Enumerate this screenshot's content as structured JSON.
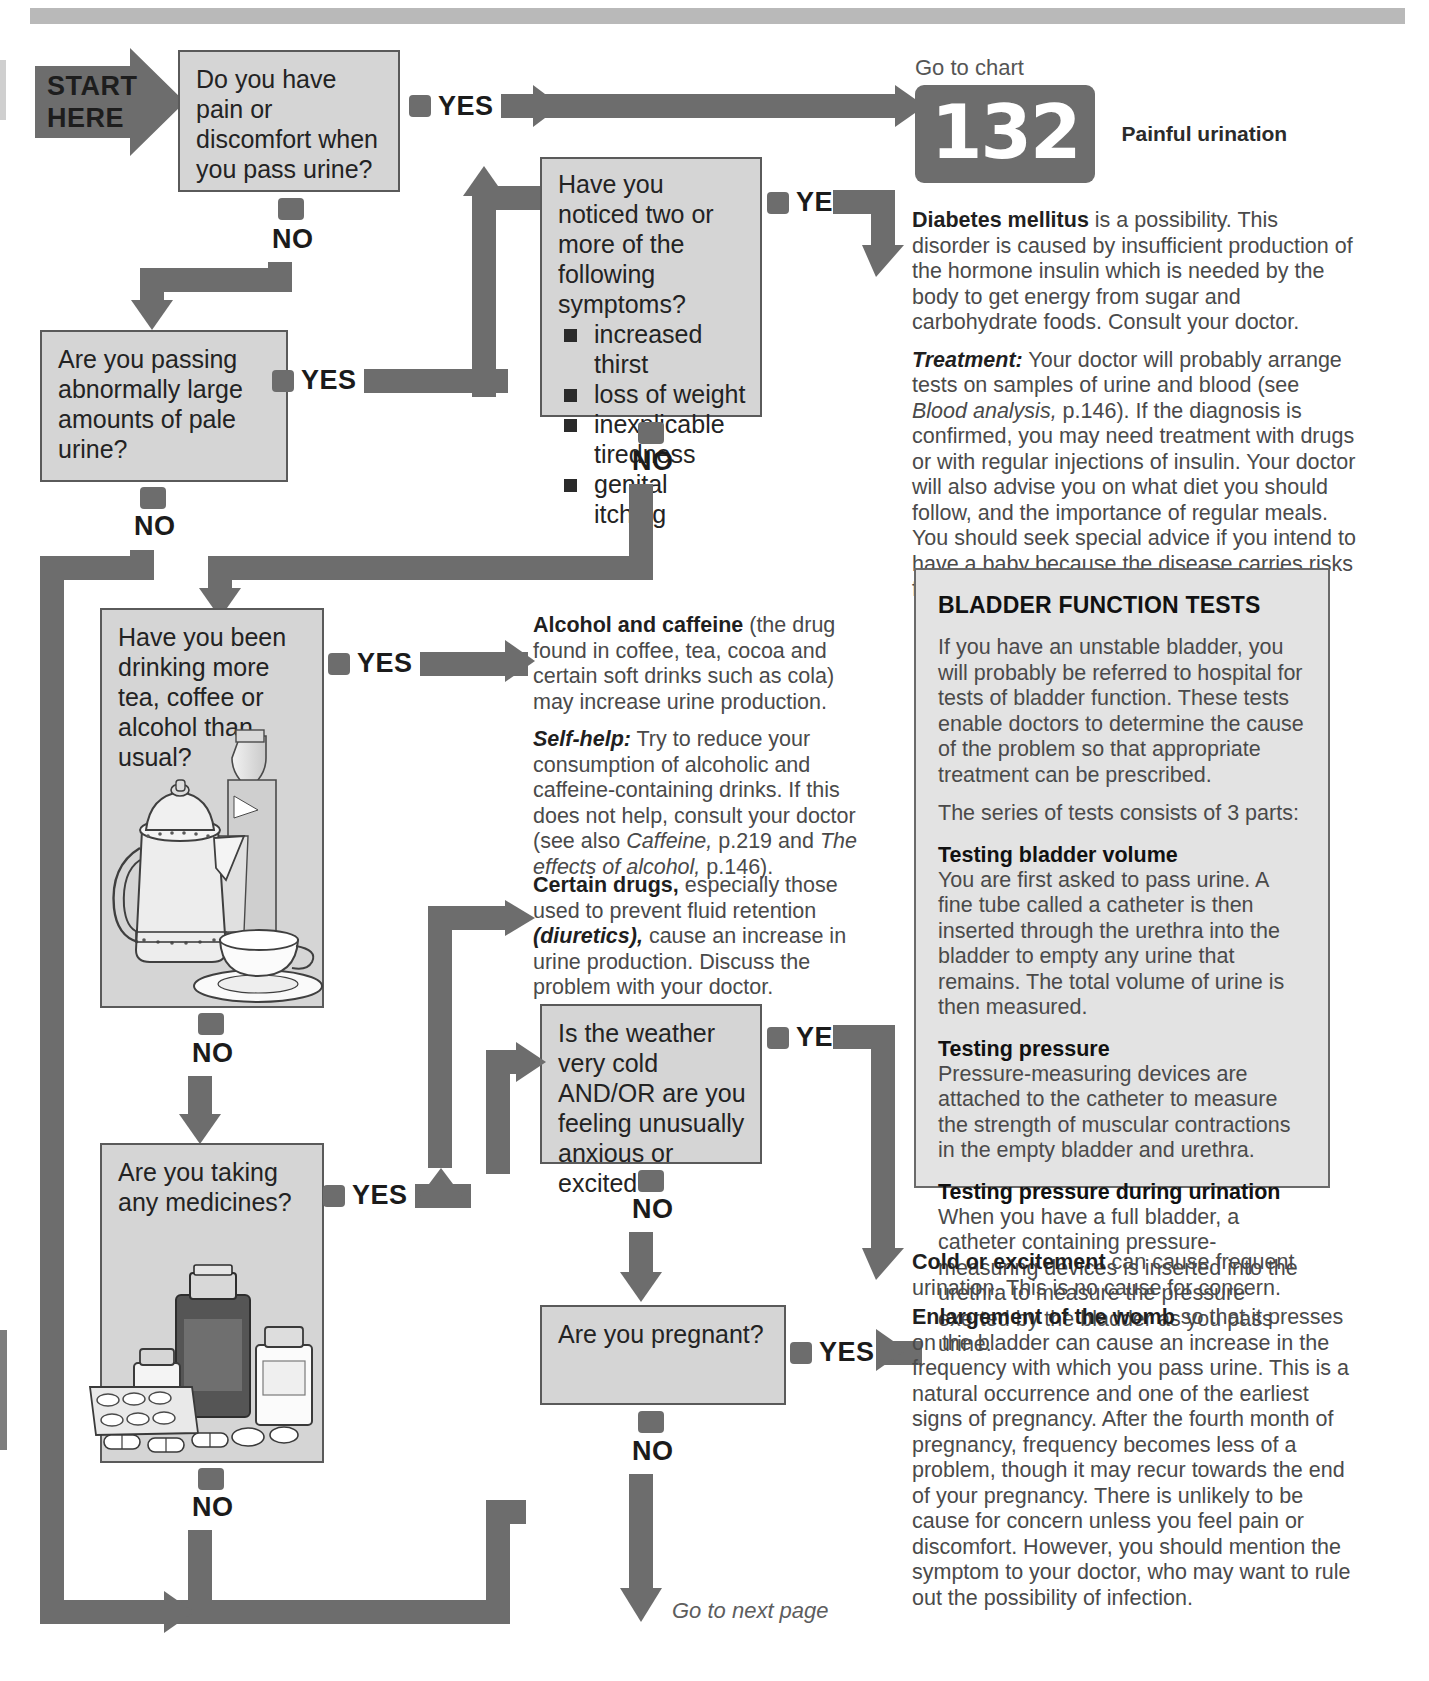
{
  "header": {
    "rule": ""
  },
  "start": {
    "line1": "START",
    "line2": "HERE"
  },
  "labels": {
    "yes": "YES",
    "no": "NO"
  },
  "boxes": {
    "q1": "Do you have pain or discomfort when you pass urine?",
    "q2": "Are you passing abnormally large amounts of pale urine?",
    "q3_title": "Have you noticed two or more of the following symptoms?",
    "q3_symptoms": [
      "increased thirst",
      "loss of weight",
      "inexplicable tiredness",
      "genital itching"
    ],
    "q4": "Have you been drinking more tea, coffee or alcohol than usual?",
    "q5": "Are you taking any medicines?",
    "q6": "Is the weather very cold AND/OR are you feeling unusually anxious or excited?",
    "q7": "Are you pregnant?"
  },
  "chart_ref": {
    "goto": "Go to chart",
    "number": "132",
    "caption": "Painful urination"
  },
  "advice": {
    "diabetes": {
      "lead": "Diabetes mellitus",
      "body": " is a possibility. This disorder is caused by insufficient production of the hormone insulin which is needed by the body to get energy from sugar and carbohydrate foods. Consult your doctor.",
      "treatment_lead": "Treatment:",
      "treatment_a": " Your doctor will probably arrange tests on samples of urine and blood (see ",
      "treatment_em1": "Blood analysis,",
      "treatment_b": " p.146). If the diagnosis is confirmed, you may need treatment with drugs or with regular injections of insulin. Your doctor will also advise you on what diet you should follow, and the importance of regular meals. You should seek special advice if you intend to have a baby because the disease carries risks for both mother and unborn baby."
    },
    "alcohol": {
      "lead": "Alcohol and caffeine",
      "body": " (the drug found in coffee, tea, cocoa and certain soft drinks such as cola) may increase urine production.",
      "selfhelp_lead": "Self-help:",
      "selfhelp_a": " Try to reduce your consumption of alcoholic and caffeine-containing drinks. If this does not help, consult your doctor (see also ",
      "selfhelp_em1": "Caffeine,",
      "selfhelp_mid": " p.219  and ",
      "selfhelp_em2": "The effects of alcohol,",
      "selfhelp_b": " p.146)."
    },
    "drugs": {
      "lead": "Certain drugs,",
      "body_a": " especially those used to prevent fluid retention ",
      "em": "(diuretics),",
      "body_b": " cause an increase in urine production. Discuss the problem with your doctor."
    },
    "cold": {
      "lead": "Cold or excitement",
      "body": " can cause frequent urination. This is no cause for concern."
    },
    "womb": {
      "lead": "Enlargement of the womb",
      "body": " so that it presses on the bladder can cause an increase in the frequency with which you pass urine. This is a natural occurrence and one of the earliest signs of pregnancy. After the fourth month of pregnancy, frequency becomes less of a problem, though it may recur towards the end of your pregnancy. There is unlikely to be cause for concern unless you feel pain or discomfort. However, you should mention the symptom to your doctor, who may want to rule out the possibility of infection."
    }
  },
  "panel": {
    "title": "BLADDER FUNCTION TESTS",
    "p1": "If you have an unstable bladder, you will probably be referred to hospital for tests of bladder function. These tests enable doctors to determine the cause of the problem so that appropriate treatment can be prescribed.",
    "p2": "The series of tests consists of 3 parts:",
    "h1": "Testing bladder volume",
    "p3": "You are first asked to pass urine. A fine tube called a catheter is then inserted through the urethra into the bladder to empty any urine that remains. The total volume of urine is then measured.",
    "h2": "Testing pressure",
    "p4": "Pressure-measuring devices are attached to the catheter to measure the strength of muscular contractions in the empty bladder and urethra.",
    "h3": "Testing pressure during urination",
    "p5": "When you have a full bladder, a catheter containing pressure-measuring devices is inserted into the urethra to measure the pressure exerted by the bladder as you pass urine."
  },
  "footer": {
    "next_page": "Go to next page"
  },
  "colors": {
    "connector": "#6d6d6d",
    "box_fill": "#d5d5d5",
    "box_border": "#5a5a5a",
    "panel_fill": "#e3e3e3",
    "rule": "#b9b9b9"
  },
  "illustrations": {
    "drinks": "coffee-pot-bottle-cup-illustration",
    "medicines": "pill-bottles-capsules-illustration"
  }
}
